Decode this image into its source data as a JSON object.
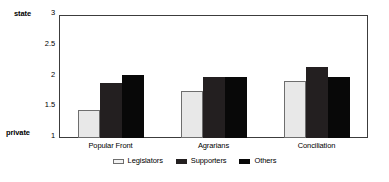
{
  "chart_data": {
    "type": "bar",
    "title": "",
    "xlabel": "",
    "ylabel": "",
    "categories": [
      "Popular Front",
      "Agrarians",
      "Conciliation"
    ],
    "series": [
      {
        "name": "Legislators",
        "color": "#e8e8e8",
        "values": [
          1.45,
          1.77,
          1.92
        ]
      },
      {
        "name": "Supporters",
        "color": "#231f20",
        "values": [
          1.9,
          2.0,
          2.15
        ]
      },
      {
        "name": "Others",
        "color": "#080808",
        "values": [
          2.02,
          2.0,
          2.0
        ]
      }
    ],
    "ylim": [
      1,
      3
    ],
    "yticks": [
      "1",
      "1.5",
      "2",
      "2.5",
      "3"
    ],
    "ytick_values": [
      1,
      1.5,
      2,
      2.5,
      3
    ],
    "axis_endpoint_labels": {
      "top": "state",
      "bottom": "private"
    },
    "grid": false,
    "legend_position": "bottom-center"
  }
}
